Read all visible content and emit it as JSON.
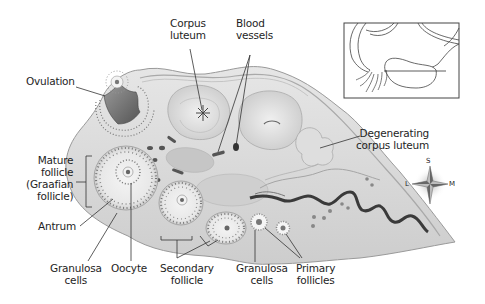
{
  "diagram": {
    "labels": {
      "ovulation": "Ovulation",
      "corpus_luteum": "Corpus\nluteum",
      "blood_vessels": "Blood\nvessels",
      "degenerating_corpus_luteum": "Degenerating\ncorpus luteum",
      "mature_follicle": "Mature\nfollicle\n(Graafian\nfollicle)",
      "antrum": "Antrum",
      "granulosa_cells_left": "Granulosa\ncells",
      "oocyte": "Oocyte",
      "secondary_follicle": "Secondary\nfollicle",
      "granulosa_cells_right": "Granulosa\ncells",
      "primary_follicles": "Primary\nfollicles"
    },
    "compass": {
      "top": "S",
      "left": "L",
      "right": "M"
    },
    "inset": {
      "description": "Locator drawing of ovary with uterine tube; line marks plane of section"
    },
    "colors": {
      "tissue": "#d9d9d9",
      "tissue_dark": "#a8a8a8",
      "outline": "#8a8a8a",
      "ink": "#1e1e1e",
      "cavity": "#6e6e6e",
      "vessel": "#3a3a3a"
    }
  }
}
